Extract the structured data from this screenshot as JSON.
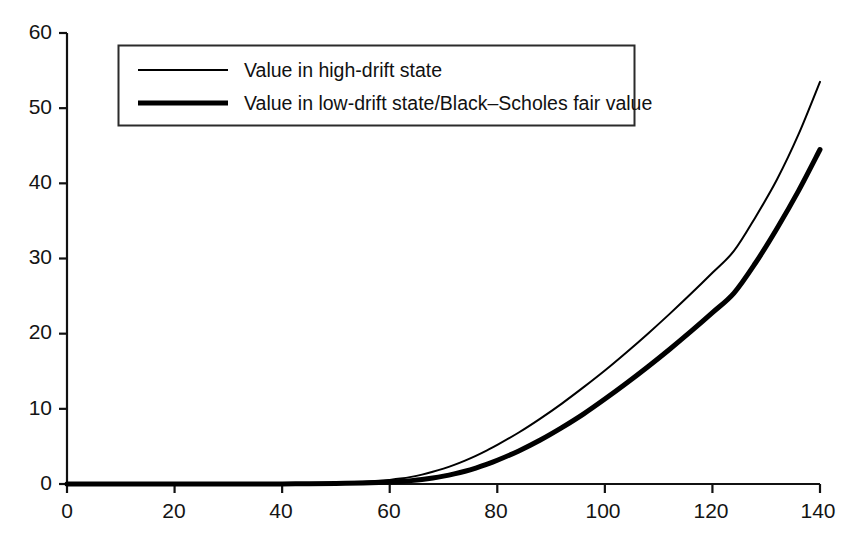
{
  "chart_data": {
    "type": "line",
    "title": "",
    "xlabel": "",
    "ylabel": "",
    "xlim": [
      0,
      140
    ],
    "ylim": [
      0,
      60
    ],
    "xticks": [
      0,
      20,
      40,
      60,
      80,
      100,
      120,
      140
    ],
    "yticks": [
      0,
      10,
      20,
      30,
      40,
      50,
      60
    ],
    "grid": false,
    "legend_position": "upper-left-inside",
    "legend_entries": [
      "Value in high-drift state",
      "Value in low-drift state/Black–Scholes fair value"
    ],
    "x": [
      0,
      5,
      10,
      15,
      20,
      25,
      30,
      35,
      40,
      45,
      50,
      55,
      58,
      60,
      62,
      64,
      66,
      68,
      70,
      72,
      74,
      76,
      78,
      80,
      84,
      88,
      92,
      96,
      100,
      104,
      108,
      112,
      116,
      120,
      124,
      128,
      132,
      136,
      140
    ],
    "series": [
      {
        "name": "Value in high-drift state",
        "style": "thin",
        "linewidth_px": 2,
        "color": "#000000",
        "values": [
          0,
          0,
          0,
          0,
          0,
          0,
          0,
          0.02,
          0.05,
          0.1,
          0.18,
          0.3,
          0.42,
          0.55,
          0.72,
          0.95,
          1.25,
          1.62,
          2.05,
          2.55,
          3.12,
          3.75,
          4.45,
          5.2,
          6.85,
          8.7,
          10.7,
          12.85,
          15.1,
          17.5,
          20.0,
          22.6,
          25.3,
          28.1,
          31.0,
          35.5,
          40.5,
          46.5,
          53.5
        ]
      },
      {
        "name": "Value in low-drift state/Black–Scholes fair value",
        "style": "thick",
        "linewidth_px": 5,
        "color": "#000000",
        "values": [
          0,
          0,
          0,
          0,
          0,
          0,
          0,
          0,
          0.01,
          0.03,
          0.07,
          0.14,
          0.2,
          0.26,
          0.34,
          0.45,
          0.6,
          0.8,
          1.05,
          1.35,
          1.7,
          2.12,
          2.6,
          3.15,
          4.4,
          5.85,
          7.5,
          9.3,
          11.3,
          13.4,
          15.6,
          17.9,
          20.3,
          22.8,
          25.4,
          29.4,
          34.0,
          39.0,
          44.5
        ]
      }
    ]
  },
  "axes": {
    "x_tick_labels": [
      "0",
      "20",
      "40",
      "60",
      "80",
      "100",
      "120",
      "140"
    ],
    "y_tick_labels": [
      "0",
      "10",
      "20",
      "30",
      "40",
      "50",
      "60"
    ]
  },
  "legend": {
    "entry_1": "Value in high-drift state",
    "entry_2": "Value in low-drift state/Black–Scholes fair value"
  },
  "colors": {
    "background": "#ffffff",
    "axis": "#111111",
    "line": "#000000",
    "legend_border": "#2b2b2b"
  }
}
